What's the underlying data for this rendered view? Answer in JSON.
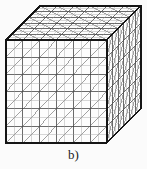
{
  "figure": {
    "caption": "b)",
    "kind": "3d-hexahedral-mesh-cube",
    "background_color": "#fbfbfb",
    "line_color": "#2b2b2b",
    "outline_color": "#111111",
    "face_fill_color": "#fdfdfd",
    "diagonal_color": "#444444",
    "inner_tick_color": "#8a8a8a"
  },
  "geometry": {
    "front_face": {
      "name": "front",
      "columns": 6,
      "rows": 6,
      "origin_x": 6,
      "origin_y": 40,
      "cell_width": 16.8,
      "cell_height": 17.2,
      "diagonal_direction": "bottom-left-to-top-right"
    },
    "top_face": {
      "name": "top",
      "columns": 6,
      "depth_rows": 6,
      "diagonal_direction": "bottom-left-to-top-right"
    },
    "right_face": {
      "name": "right",
      "rows": 6,
      "depth_columns": 6,
      "diagonal_direction": "bottom-left-to-top-right"
    },
    "depth_vector": {
      "dx": 34,
      "dy": -34
    },
    "cube_corners": {
      "front_top_left": [
        6,
        40
      ],
      "front_top_right": [
        106.8,
        40
      ],
      "front_bottom_left": [
        6,
        143
      ],
      "front_bottom_right": [
        106.8,
        143
      ],
      "back_top_left": [
        40,
        6
      ],
      "back_top_right": [
        140.8,
        6
      ],
      "back_bottom_right": [
        140.8,
        109
      ]
    }
  },
  "counts": {
    "divisions_per_edge": 6,
    "visible_faces": 3,
    "surface_quads_per_face": 36,
    "surface_triangles_per_face": 72
  }
}
